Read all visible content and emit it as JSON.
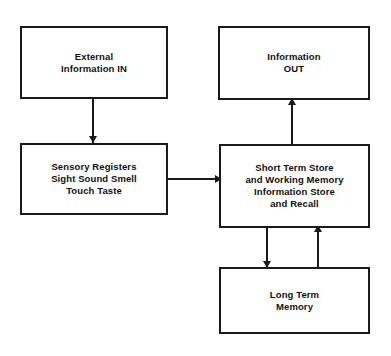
{
  "diagram": {
    "background_color": "#ffffff",
    "stroke_color": "#1a1a1a",
    "text_color": "#111111",
    "nodes": [
      {
        "id": "external-information-in",
        "lines": [
          "External",
          "Information IN"
        ]
      },
      {
        "id": "information-out",
        "lines": [
          "Information",
          "OUT"
        ]
      },
      {
        "id": "sensory-registers",
        "lines": [
          "Sensory Registers",
          "Sight Sound Smell",
          "Touch Taste"
        ]
      },
      {
        "id": "short-term-store",
        "lines": [
          "Short Term Store",
          "and Working Memory",
          "Information Store",
          "and Recall"
        ]
      },
      {
        "id": "long-term-memory",
        "lines": [
          "Long Term",
          "Memory"
        ]
      }
    ],
    "connectors": [
      {
        "id": "external-to-sensory",
        "from": "external-information-in",
        "to": "sensory-registers",
        "direction": "down"
      },
      {
        "id": "sensory-to-short-term",
        "from": "sensory-registers",
        "to": "short-term-store",
        "direction": "right"
      },
      {
        "id": "short-term-to-information-out",
        "from": "short-term-store",
        "to": "information-out",
        "direction": "up"
      },
      {
        "id": "short-term-to-long-term",
        "from": "short-term-store",
        "to": "long-term-memory",
        "direction": "down"
      },
      {
        "id": "long-term-to-short-term",
        "from": "long-term-memory",
        "to": "short-term-store",
        "direction": "up"
      }
    ]
  }
}
